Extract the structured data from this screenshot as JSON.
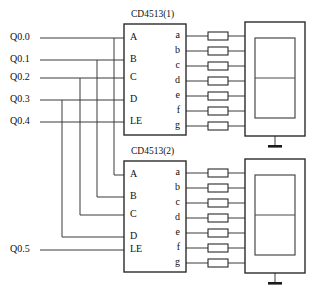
{
  "diagram": {
    "background": "#ffffff",
    "line_color": "#3a3a3a",
    "box_color": "#2b2b2b",
    "text_color": "#101010"
  },
  "signals": [
    {
      "label": "Q0.0",
      "x": 10,
      "y": 38
    },
    {
      "label": "Q0.1",
      "x": 10,
      "y": 60
    },
    {
      "label": "Q0.2",
      "x": 10,
      "y": 78
    },
    {
      "label": "Q0.3",
      "x": 10,
      "y": 100
    },
    {
      "label": "Q0.4",
      "x": 10,
      "y": 122
    },
    {
      "label": "Q0.5",
      "x": 10,
      "y": 250
    }
  ],
  "chips": [
    {
      "name": "CD4513(1)",
      "label_x": 131,
      "label_y": 15,
      "box": {
        "x": 124,
        "y": 24,
        "w": 62,
        "h": 111
      },
      "inputs": [
        {
          "label": "A",
          "y": 38
        },
        {
          "label": "B",
          "y": 60
        },
        {
          "label": "C",
          "y": 78
        },
        {
          "label": "D",
          "y": 100
        },
        {
          "label": "LE",
          "y": 122
        }
      ],
      "outputs": [
        {
          "label": "a",
          "y": 36
        },
        {
          "label": "b",
          "y": 51
        },
        {
          "label": "c",
          "y": 66
        },
        {
          "label": "d",
          "y": 81
        },
        {
          "label": "e",
          "y": 96
        },
        {
          "label": "f",
          "y": 111
        },
        {
          "label": "g",
          "y": 126
        }
      ]
    },
    {
      "name": "CD4513(2)",
      "label_x": 131,
      "label_y": 152,
      "box": {
        "x": 124,
        "y": 161,
        "w": 62,
        "h": 111
      },
      "inputs": [
        {
          "label": "A",
          "y": 175
        },
        {
          "label": "B",
          "y": 197
        },
        {
          "label": "C",
          "y": 215
        },
        {
          "label": "D",
          "y": 237
        },
        {
          "label": "LE",
          "y": 250
        }
      ],
      "outputs": [
        {
          "label": "a",
          "y": 173
        },
        {
          "label": "b",
          "y": 188
        },
        {
          "label": "c",
          "y": 203
        },
        {
          "label": "d",
          "y": 218
        },
        {
          "label": "e",
          "y": 233
        },
        {
          "label": "f",
          "y": 248
        },
        {
          "label": "g",
          "y": 263
        }
      ]
    }
  ],
  "displays": [
    {
      "name": "seven-segment-display-1",
      "box": {
        "x": 245,
        "y": 22,
        "w": 60,
        "h": 114
      },
      "digit": {
        "x": 255,
        "y": 38,
        "w": 40,
        "h": 80
      },
      "ground": {
        "x": 275,
        "y": 136,
        "stem": 9,
        "bar": 14
      }
    },
    {
      "name": "seven-segment-display-2",
      "box": {
        "x": 245,
        "y": 159,
        "w": 60,
        "h": 114
      },
      "digit": {
        "x": 255,
        "y": 175,
        "w": 40,
        "h": 80
      },
      "ground": {
        "x": 275,
        "y": 273,
        "stem": 9,
        "bar": 14
      }
    }
  ],
  "resistors": {
    "x": 208,
    "width": 20,
    "height": 8,
    "count_per_chip": 7
  },
  "bus": {
    "description": "vertical drop wires routing Q0.0-Q0.3 down to chip 2 inputs A-D",
    "lines": [
      {
        "from_signal": "Q0.0",
        "x": 114,
        "y_top": 38,
        "y_bottom": 175,
        "to_pin": "A"
      },
      {
        "from_signal": "Q0.1",
        "x": 97,
        "y_top": 60,
        "y_bottom": 197,
        "to_pin": "B"
      },
      {
        "from_signal": "Q0.2",
        "x": 80,
        "y_top": 78,
        "y_bottom": 215,
        "to_pin": "C"
      },
      {
        "from_signal": "Q0.3",
        "x": 62,
        "y_top": 100,
        "y_bottom": 237,
        "to_pin": "D"
      }
    ]
  },
  "connections": {
    "input_wire_start_x": 40,
    "chip_input_x": 124,
    "chip_output_x": 186,
    "resistor_left_x": 208,
    "resistor_right_x": 228,
    "display_left_x": 245
  }
}
